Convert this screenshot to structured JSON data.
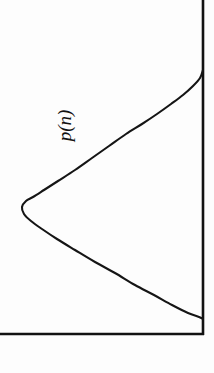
{
  "figure": {
    "title": "",
    "label": "p(n)",
    "background_color": "#fdfdfd",
    "ink_color": "#151515",
    "orientation": "rotated-90-ccw",
    "width_px": 214,
    "height_px": 373
  },
  "axes": {
    "vertical_axis_name": "n-axis",
    "horizontal_axis_name": "baseline",
    "vertical_axis_x": 203,
    "horizontal_axis_y": 334,
    "stroke_width": 2.2,
    "color": "#121212"
  },
  "annotations": [
    {
      "name": "curve-label",
      "text": "p(n)",
      "x": 65,
      "y": 125,
      "rotation_deg": -90,
      "italic": true
    }
  ],
  "chart_data": {
    "type": "line",
    "title": "",
    "xlabel": "",
    "ylabel": "p(n)",
    "grid": false,
    "legend": null,
    "orientation": "horizontal-density-rotated",
    "axis_ranges": {
      "n_axis_pixels": [
        0,
        334
      ],
      "p_axis_pixels": [
        203,
        22
      ]
    },
    "series": [
      {
        "name": "p(n)",
        "peak": {
          "n_px": 203,
          "p_px": 22
        },
        "points": [
          {
            "x": 203,
            "y": 70
          },
          {
            "x": 200,
            "y": 78
          },
          {
            "x": 193,
            "y": 86
          },
          {
            "x": 183,
            "y": 95
          },
          {
            "x": 171,
            "y": 104
          },
          {
            "x": 157,
            "y": 114
          },
          {
            "x": 142,
            "y": 124
          },
          {
            "x": 126,
            "y": 134
          },
          {
            "x": 109,
            "y": 146
          },
          {
            "x": 92,
            "y": 158
          },
          {
            "x": 75,
            "y": 170
          },
          {
            "x": 58,
            "y": 181
          },
          {
            "x": 44,
            "y": 190
          },
          {
            "x": 33,
            "y": 197
          },
          {
            "x": 26,
            "y": 201
          },
          {
            "x": 22,
            "y": 207
          },
          {
            "x": 24,
            "y": 214
          },
          {
            "x": 31,
            "y": 221
          },
          {
            "x": 42,
            "y": 229
          },
          {
            "x": 57,
            "y": 239
          },
          {
            "x": 75,
            "y": 250
          },
          {
            "x": 95,
            "y": 262
          },
          {
            "x": 115,
            "y": 273
          },
          {
            "x": 135,
            "y": 285
          },
          {
            "x": 154,
            "y": 295
          },
          {
            "x": 172,
            "y": 305
          },
          {
            "x": 188,
            "y": 313
          },
          {
            "x": 199,
            "y": 317
          },
          {
            "x": 203,
            "y": 319
          }
        ]
      }
    ]
  }
}
